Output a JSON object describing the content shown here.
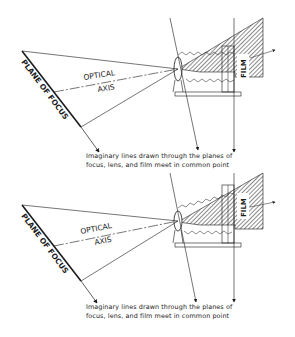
{
  "figures": [
    {
      "id": "top",
      "labels": {
        "plane": "PLANE OF FOCUS",
        "optical_line1": "OPTICAL",
        "optical_line2": "AXIS",
        "film": "FILM"
      },
      "caption": {
        "line1": "Imaginary lines drawn through the planes of",
        "line2": "focus, lens, and film meet in common point"
      }
    },
    {
      "id": "bottom",
      "labels": {
        "plane": "PLANE OF FOCUS",
        "optical_line1": "OPTICAL",
        "optical_line2": "AXIS",
        "film": "FILM"
      },
      "caption": {
        "line1": "Imaginary lines drawn through the planes of",
        "line2": "focus, lens, and film meet in common point"
      }
    }
  ],
  "colors": {
    "ink": "#1a1a1a",
    "background": "#ffffff"
  }
}
